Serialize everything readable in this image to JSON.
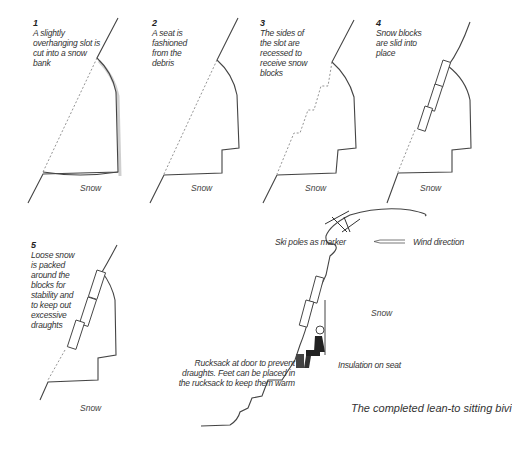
{
  "steps": [
    {
      "number": "1",
      "text": "A slightly overhanging slot is cut into a snow bank",
      "ground": "Snow"
    },
    {
      "number": "2",
      "text": "A seat is fashioned from the debris",
      "ground": "Snow"
    },
    {
      "number": "3",
      "text": "The sides of the slot are recessed to receive snow blocks",
      "ground": "Snow"
    },
    {
      "number": "4",
      "text": "Snow blocks are slid into place",
      "ground": "Snow"
    },
    {
      "number": "5",
      "text": "Loose snow is packed around the blocks for stability and to keep out excessive draughts",
      "ground": "Snow"
    }
  ],
  "final": {
    "ski_poles": "Ski poles as marker",
    "wind": "Wind direction",
    "snow": "Snow",
    "rucksack": "Rucksack at door to prevent draughts. Feet can be placed in the rucksack to keep them warm",
    "insulation": "Insulation on seat",
    "caption": "The completed lean-to sitting bivi"
  }
}
